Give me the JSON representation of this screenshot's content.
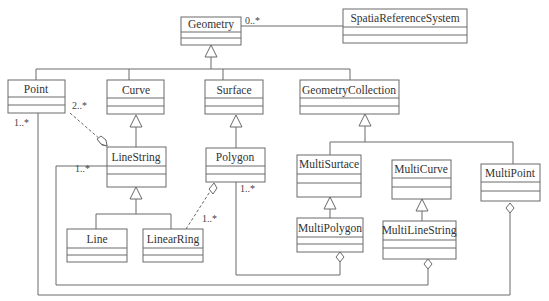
{
  "diagram": {
    "type": "uml-class-diagram",
    "classes": {
      "geometry": "Geometry",
      "spatial_reference_system": "SpatiaReferenceSystem",
      "point": "Point",
      "curve": "Curve",
      "surface": "Surface",
      "geometry_collection": "GeometryCollection",
      "line_string": "LineString",
      "polygon": "Polygon",
      "multi_surface": "MultiSurtace",
      "multi_curve": "MultiCurve",
      "multi_point": "MultiPoint",
      "line": "Line",
      "linear_ring": "LinearRing",
      "multi_polygon": "MultiPolygon",
      "multi_line_string": "MultiLineString"
    },
    "multiplicities": {
      "geometry_srs": "0..*",
      "point_linestring": "2..*",
      "point_multipoint": "1..*",
      "linestring_multilinestring": "1..*",
      "polygon_multipolygon": "1..*",
      "linearring_polygon": "1..*"
    },
    "relations": [
      {
        "from": "Geometry",
        "to": "SpatiaReferenceSystem",
        "kind": "association",
        "mult": "0..*"
      },
      {
        "from": "Point",
        "to": "Geometry",
        "kind": "generalization"
      },
      {
        "from": "Curve",
        "to": "Geometry",
        "kind": "generalization"
      },
      {
        "from": "Surface",
        "to": "Geometry",
        "kind": "generalization"
      },
      {
        "from": "GeometryCollection",
        "to": "Geometry",
        "kind": "generalization"
      },
      {
        "from": "LineString",
        "to": "Curve",
        "kind": "generalization"
      },
      {
        "from": "Polygon",
        "to": "Surface",
        "kind": "generalization"
      },
      {
        "from": "MultiSurtace",
        "to": "GeometryCollection",
        "kind": "generalization"
      },
      {
        "from": "MultiCurve",
        "to": "GeometryCollection",
        "kind": "generalization"
      },
      {
        "from": "MultiPoint",
        "to": "GeometryCollection",
        "kind": "generalization"
      },
      {
        "from": "Line",
        "to": "LineString",
        "kind": "generalization"
      },
      {
        "from": "LinearRing",
        "to": "LineString",
        "kind": "generalization"
      },
      {
        "from": "MultiPolygon",
        "to": "MultiSurtace",
        "kind": "generalization"
      },
      {
        "from": "MultiLineString",
        "to": "MultiCurve",
        "kind": "generalization"
      },
      {
        "from": "Point",
        "to": "LineString",
        "kind": "aggregation",
        "mult": "2..*"
      },
      {
        "from": "LinearRing",
        "to": "Polygon",
        "kind": "aggregation",
        "mult": "1..*"
      },
      {
        "from": "Polygon",
        "to": "MultiPolygon",
        "kind": "aggregation",
        "mult": "1..*"
      },
      {
        "from": "LineString",
        "to": "MultiLineString",
        "kind": "aggregation",
        "mult": "1..*"
      },
      {
        "from": "Point",
        "to": "MultiPoint",
        "kind": "aggregation",
        "mult": "1..*"
      }
    ]
  }
}
